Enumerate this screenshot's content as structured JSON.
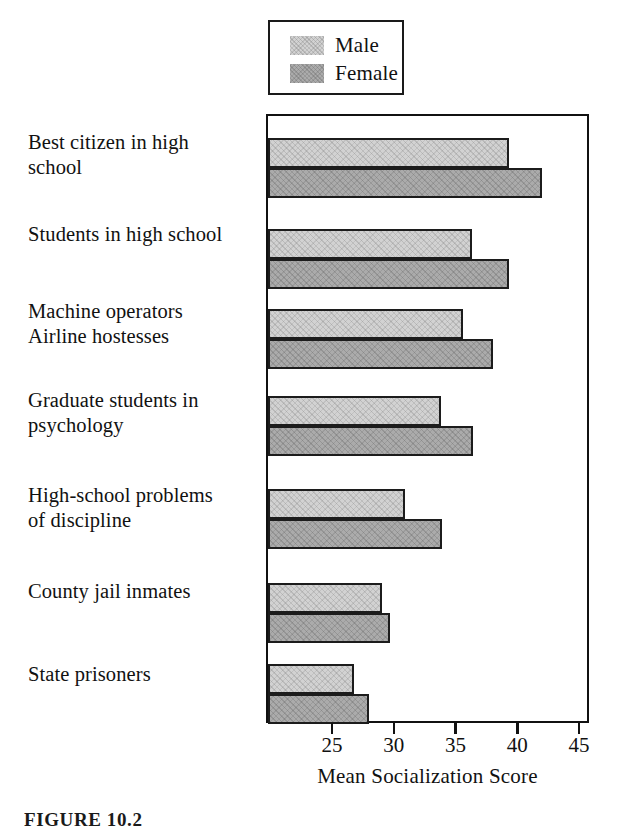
{
  "figure": {
    "caption": "FIGURE 10.2",
    "axis_title": "Mean Socialization Score"
  },
  "legend": {
    "position": "top-left-above-plot",
    "entries": [
      {
        "label": "Male",
        "color": "#d2d2d2",
        "pattern": "light-hatch"
      },
      {
        "label": "Female",
        "color": "#ababab",
        "pattern": "medium-hatch"
      }
    ]
  },
  "chart_data": {
    "type": "bar",
    "orientation": "horizontal",
    "title": "",
    "subtitle": "",
    "xlabel": "Mean Socialization Score",
    "ylabel": "",
    "xlim": [
      19.9,
      45.9
    ],
    "xticks": [
      25,
      30,
      35,
      40,
      45
    ],
    "xticklabels": [
      "25",
      "30",
      "35",
      "40",
      "45"
    ],
    "grid": false,
    "legend_position": "above-plot-left",
    "categories": [
      "Best citizen in high school",
      "Students in high school",
      "Machine operators / Airline hostesses",
      "Graduate students in psychology",
      "High-school problems of discipline",
      "County jail inmates",
      "State prisoners"
    ],
    "category_labels_display": [
      [
        "Best citizen in high",
        "school"
      ],
      [
        "Students in high school"
      ],
      [
        "Machine operators",
        "Airline hostesses"
      ],
      [
        "Graduate students in",
        "psychology"
      ],
      [
        "High-school problems",
        "of discipline"
      ],
      [
        "County jail inmates"
      ],
      [
        "State prisoners"
      ]
    ],
    "series": [
      {
        "name": "Male",
        "color": "#d2d2d2",
        "values": [
          39.4,
          36.4,
          35.7,
          33.9,
          31.0,
          29.1,
          26.9
        ]
      },
      {
        "name": "Female",
        "color": "#ababab",
        "values": [
          42.1,
          39.4,
          38.1,
          36.5,
          34.0,
          29.8,
          28.1
        ]
      }
    ]
  }
}
